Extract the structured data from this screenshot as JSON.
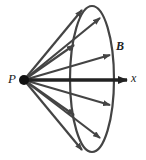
{
  "diagram": {
    "labels": {
      "point": "P",
      "field": "B",
      "axis": "x"
    },
    "colors": {
      "stroke": "#444444",
      "axis": "#222222",
      "background": "#ffffff"
    },
    "point_p": {
      "x": 24,
      "y": 80
    },
    "ellipse": {
      "cx": 92,
      "cy": 79,
      "rx": 22,
      "ry": 73
    },
    "vectors": [
      {
        "x2": 82,
        "y2": 10
      },
      {
        "x2": 100,
        "y2": 18
      },
      {
        "x2": 74,
        "y2": 45
      },
      {
        "x2": 110,
        "y2": 55
      },
      {
        "x2": 127,
        "y2": 80
      },
      {
        "x2": 110,
        "y2": 105
      },
      {
        "x2": 74,
        "y2": 115
      },
      {
        "x2": 100,
        "y2": 138
      },
      {
        "x2": 82,
        "y2": 150
      }
    ]
  }
}
